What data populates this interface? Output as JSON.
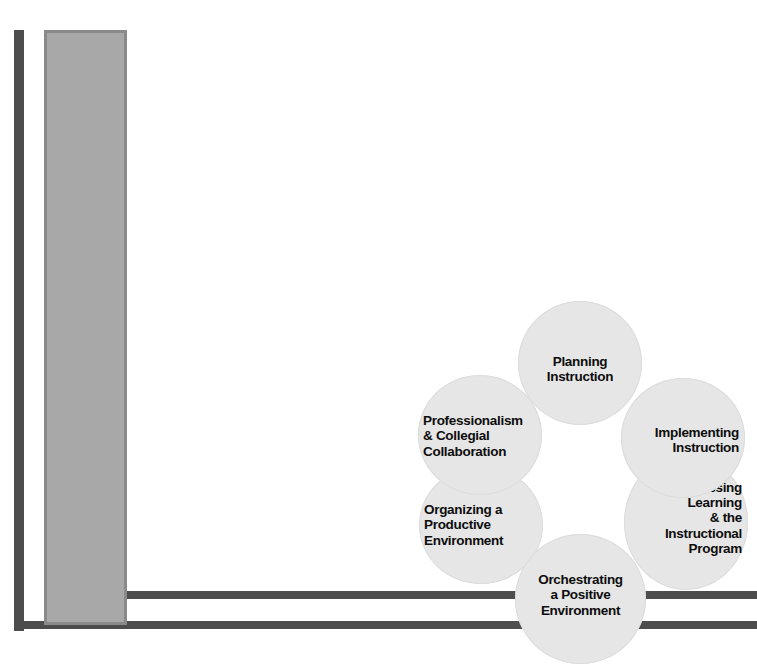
{
  "figure": {
    "background_color": "#ffffff",
    "bar_color": "#4d4d4d",
    "panel_fill_color": "#a8a8a8",
    "panel_border_color": "#8a8a8a",
    "circle_fill_color": "#e6e6e6",
    "circle_text_color": "#0d0d0d"
  },
  "frame": {
    "thin_vertical_bar": "",
    "baseline_bar": "",
    "upper_horizontal_bar": "",
    "side_panel": ""
  },
  "diagram": {
    "type": "cycle-ring",
    "node_count": 6,
    "nodes": [
      {
        "id": "planning",
        "label": "Planning\nInstruction",
        "align": "center",
        "position": "top"
      },
      {
        "id": "implementing",
        "label": "Implementing\nInstruction",
        "align": "right",
        "position": "upper-right"
      },
      {
        "id": "assessing",
        "label": "Assessing\nLearning\n& the\nInstructional\nProgram",
        "align": "right",
        "position": "lower-right"
      },
      {
        "id": "orchestrating",
        "label": "Orchestrating\na Positive\nEnvironment",
        "align": "center",
        "position": "bottom"
      },
      {
        "id": "organizing",
        "label": "Organizing a\nProductive\nEnvironment",
        "align": "left",
        "position": "lower-left"
      },
      {
        "id": "professionalism",
        "label": "Professionalism\n& Collegial\nCollaboration",
        "align": "left",
        "position": "upper-left"
      }
    ]
  }
}
